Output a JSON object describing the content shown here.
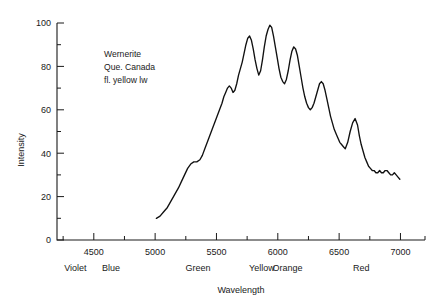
{
  "figure": {
    "annotation": {
      "line1": "Wernerite",
      "line2": "Que. Canada",
      "line3": "fl. yellow lw"
    }
  },
  "chart_data": {
    "type": "line",
    "title": "",
    "subtitle": "",
    "xlabel": "Wavelength",
    "ylabel": "Intensity",
    "xlim": [
      4200,
      7200
    ],
    "ylim": [
      0,
      100
    ],
    "grid": false,
    "legend": null,
    "x_tick_labels": [
      "4500",
      "5000",
      "5500",
      "6000",
      "6500",
      "7000"
    ],
    "x_ticks": [
      4500,
      5000,
      5500,
      6000,
      6500,
      7000
    ],
    "x_minor_ticks": [
      4250,
      4750,
      5250,
      5750,
      6250,
      6750,
      7200
    ],
    "y_tick_labels": [
      "0",
      "20",
      "40",
      "60",
      "80",
      "100"
    ],
    "y_ticks": [
      0,
      20,
      40,
      60,
      80,
      100
    ],
    "y_minor_ticks": [
      10,
      30,
      50,
      70,
      90
    ],
    "color_bands": [
      {
        "label": "Violet",
        "x": 4350
      },
      {
        "label": "Blue",
        "x": 4640
      },
      {
        "label": "Green",
        "x": 5350
      },
      {
        "label": "Yellow",
        "x": 5870
      },
      {
        "label": "Orange",
        "x": 6080
      },
      {
        "label": "Red",
        "x": 6680
      }
    ],
    "annotations": [
      {
        "text": "Wernerite",
        "x": 5000,
        "y": 80
      },
      {
        "text": "Que. Canada",
        "x": 5000,
        "y": 74
      },
      {
        "text": "fl. yellow lw",
        "x": 5000,
        "y": 68
      }
    ],
    "series": [
      {
        "name": "Wernerite fluorescence",
        "color": "#111111",
        "x": [
          5010,
          5040,
          5070,
          5100,
          5130,
          5160,
          5190,
          5215,
          5240,
          5265,
          5290,
          5315,
          5340,
          5365,
          5385,
          5405,
          5425,
          5445,
          5465,
          5485,
          5505,
          5525,
          5545,
          5560,
          5575,
          5590,
          5605,
          5620,
          5635,
          5650,
          5665,
          5680,
          5695,
          5710,
          5725,
          5740,
          5755,
          5770,
          5785,
          5800,
          5815,
          5830,
          5845,
          5860,
          5875,
          5890,
          5905,
          5920,
          5935,
          5950,
          5965,
          5980,
          5995,
          6010,
          6025,
          6040,
          6055,
          6070,
          6085,
          6100,
          6115,
          6130,
          6145,
          6160,
          6175,
          6190,
          6205,
          6220,
          6235,
          6250,
          6265,
          6280,
          6295,
          6310,
          6325,
          6340,
          6355,
          6370,
          6385,
          6400,
          6415,
          6430,
          6445,
          6460,
          6475,
          6490,
          6505,
          6520,
          6535,
          6550,
          6570,
          6590,
          6610,
          6630,
          6650,
          6665,
          6680,
          6695,
          6710,
          6725,
          6740,
          6755,
          6770,
          6785,
          6800,
          6815,
          6830,
          6845,
          6860,
          6875,
          6890,
          6905,
          6920,
          6935,
          6950,
          6965,
          6980,
          6995
        ],
        "y": [
          10,
          11,
          13,
          15,
          18,
          21,
          24,
          27,
          30,
          33,
          35,
          36,
          36,
          37,
          39,
          42,
          45,
          48,
          51,
          54,
          57,
          60,
          63,
          66,
          68,
          70,
          71,
          70,
          68,
          69,
          72,
          76,
          79,
          82,
          86,
          90,
          93,
          94,
          92,
          88,
          83,
          79,
          76,
          78,
          83,
          89,
          94,
          97,
          99,
          98,
          94,
          89,
          84,
          79,
          75,
          73,
          72,
          74,
          78,
          83,
          87,
          89,
          88,
          85,
          80,
          75,
          70,
          66,
          63,
          61,
          60,
          61,
          63,
          66,
          69,
          72,
          73,
          72,
          69,
          65,
          61,
          57,
          54,
          51,
          49,
          47,
          45,
          44,
          43,
          42,
          45,
          50,
          54,
          56,
          53,
          48,
          44,
          41,
          38,
          36,
          34,
          33,
          32,
          32,
          31,
          31,
          32,
          31,
          31,
          32,
          32,
          31,
          30,
          30,
          31,
          30,
          29,
          28
        ]
      }
    ]
  }
}
